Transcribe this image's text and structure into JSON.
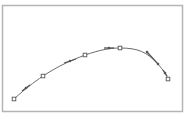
{
  "diagram": {
    "type": "curve-with-control-points",
    "frame": {
      "x": 2,
      "y": 5,
      "width": 180,
      "height": 106,
      "stroke": "#b5b5b5",
      "fill": "#ffffff"
    },
    "curve": {
      "stroke": "#6b6b6b",
      "path": "M14,99 C26,88 33,83 43,76 C60,65 70,61 85,55 C100,50 109,48 120,48 C138,48 147,52 158,64 C163,70 166,74 168,79"
    },
    "anchor_points": [
      {
        "x": 14,
        "y": 99
      },
      {
        "x": 43,
        "y": 76
      },
      {
        "x": 85,
        "y": 55
      },
      {
        "x": 120,
        "y": 48
      },
      {
        "x": 168,
        "y": 79
      }
    ],
    "handle_points": [
      {
        "x": 26,
        "y": 88
      },
      {
        "x": 70,
        "y": 61
      },
      {
        "x": 109,
        "y": 48
      },
      {
        "x": 147,
        "y": 52
      },
      {
        "x": 158,
        "y": 64
      },
      {
        "x": 165,
        "y": 73
      }
    ],
    "handle_segments": [
      {
        "x1": 22,
        "y1": 91,
        "x2": 30,
        "y2": 85
      },
      {
        "x1": 64,
        "y1": 63,
        "x2": 76,
        "y2": 59
      },
      {
        "x1": 104,
        "y1": 48,
        "x2": 114,
        "y2": 48
      },
      {
        "x1": 147,
        "y1": 52,
        "x2": 158,
        "y2": 64
      },
      {
        "x1": 163,
        "y1": 70,
        "x2": 167,
        "y2": 76
      }
    ],
    "colors": {
      "marker_stroke": "#555555",
      "handle_fill": "#555555"
    }
  }
}
